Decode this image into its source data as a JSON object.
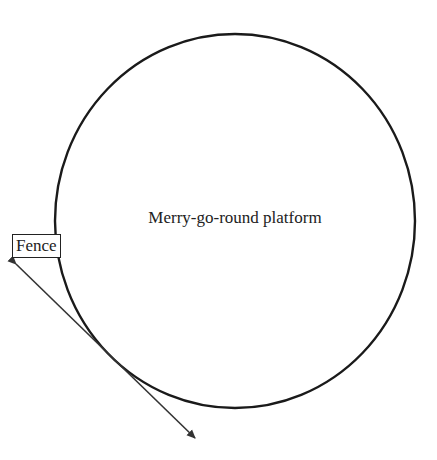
{
  "diagram": {
    "platform": {
      "label": "Merry-go-round platform",
      "shape": "circle",
      "stroke_color": "#1a1a1a"
    },
    "fence": {
      "label": "Fence",
      "shape": "double-headed arrow line tangent to platform",
      "stroke_color": "#333333"
    }
  }
}
